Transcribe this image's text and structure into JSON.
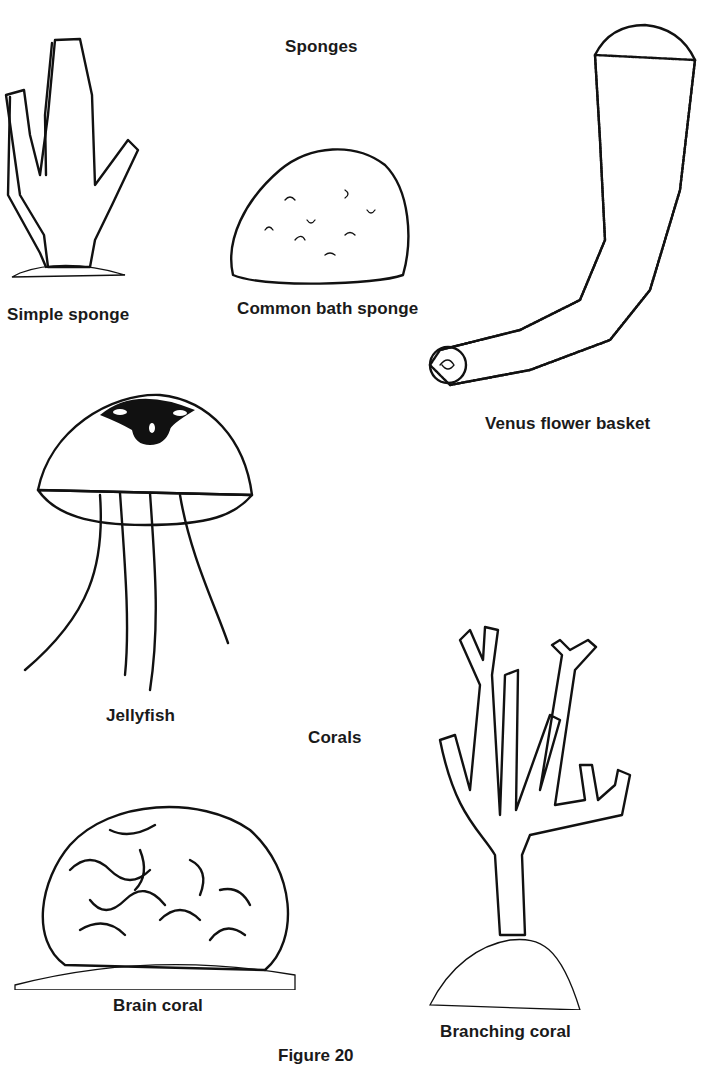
{
  "figure": {
    "headings": {
      "sponges": "Sponges",
      "corals": "Corals"
    },
    "organisms": [
      {
        "id": "simple-sponge",
        "label": "Simple sponge",
        "group": "Sponges"
      },
      {
        "id": "common-bath-sponge",
        "label": "Common bath sponge",
        "group": "Sponges"
      },
      {
        "id": "venus-flower-basket",
        "label": "Venus flower basket",
        "group": "Sponges"
      },
      {
        "id": "jellyfish",
        "label": "Jellyfish",
        "group": "Corals"
      },
      {
        "id": "brain-coral",
        "label": "Brain coral",
        "group": "Corals"
      },
      {
        "id": "branching-coral",
        "label": "Branching coral",
        "group": "Corals"
      }
    ],
    "caption": "Figure 20"
  }
}
